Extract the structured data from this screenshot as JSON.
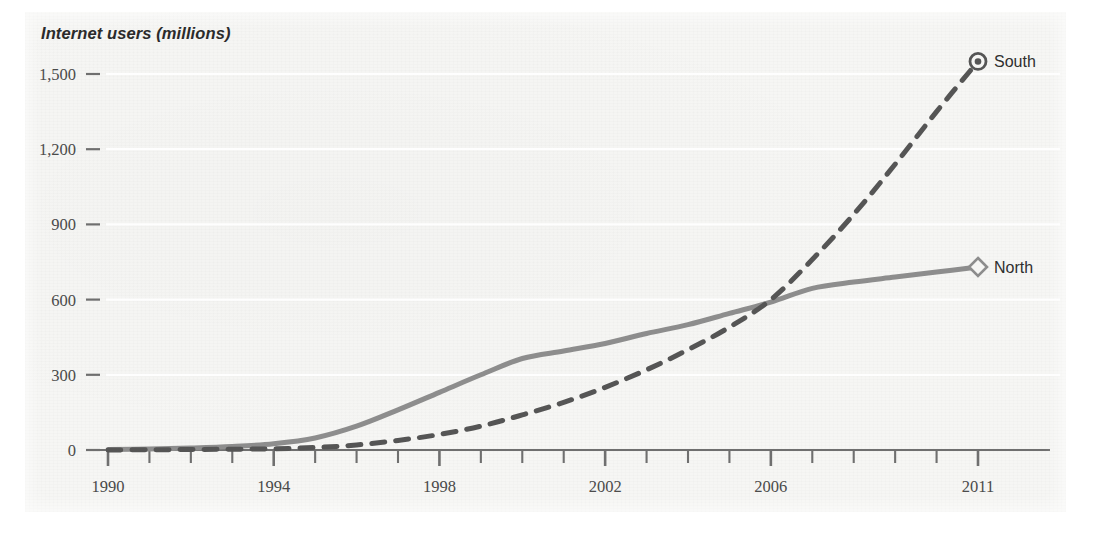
{
  "figure": {
    "background_color": "#f6f6f4",
    "panel": {
      "x": 25,
      "y": 12,
      "width": 1041,
      "height": 500
    }
  },
  "chart_data": {
    "type": "line",
    "title": "",
    "axis_title": "Internet users (millions)",
    "xlabel": "",
    "ylabel": "Internet users (millions)",
    "xlim": [
      1990,
      2011
    ],
    "ylim": [
      0,
      1600
    ],
    "grid": true,
    "grid_orientation": "horizontal",
    "legend_position": "line-end-labels",
    "y_ticks": [
      0,
      300,
      600,
      900,
      1200,
      1500
    ],
    "y_ticklabels": [
      "0",
      "300",
      "600",
      "900",
      "1,200",
      "1,500"
    ],
    "x_ticks": [
      1990,
      1991,
      1992,
      1993,
      1994,
      1995,
      1996,
      1997,
      1998,
      1999,
      2000,
      2001,
      2002,
      2003,
      2004,
      2005,
      2006,
      2007,
      2008,
      2009,
      2010,
      2011
    ],
    "x_ticklabels_shown": [
      "1990",
      "1994",
      "1998",
      "2002",
      "2006",
      "2011"
    ],
    "x_ticklabel_years": [
      1990,
      1994,
      1998,
      2002,
      2006,
      2011
    ],
    "x": [
      1990,
      1991,
      1992,
      1993,
      1994,
      1995,
      1996,
      1997,
      1998,
      1999,
      2000,
      2001,
      2002,
      2003,
      2004,
      2005,
      2006,
      2007,
      2008,
      2009,
      2010,
      2011
    ],
    "series": [
      {
        "name": "North",
        "label": "North",
        "color": "#8d8d8d",
        "linestyle": "solid",
        "linewidth": 5,
        "marker": "diamond",
        "marker_at": 2011,
        "values": [
          2,
          4,
          8,
          14,
          25,
          48,
          95,
          160,
          230,
          300,
          365,
          395,
          425,
          465,
          500,
          545,
          590,
          645,
          670,
          690,
          710,
          730
        ]
      },
      {
        "name": "South",
        "label": "South",
        "color": "#555555",
        "linestyle": "dashed",
        "linewidth": 5,
        "marker": "circle-dot",
        "marker_at": 2011,
        "values": [
          0,
          1,
          2,
          3,
          5,
          10,
          20,
          38,
          62,
          95,
          140,
          190,
          250,
          320,
          400,
          490,
          600,
          760,
          940,
          1140,
          1350,
          1550
        ]
      }
    ],
    "annotations": [
      {
        "text": "North",
        "year": 2011,
        "value": 730
      },
      {
        "text": "South",
        "year": 2011,
        "value": 1550
      }
    ]
  }
}
